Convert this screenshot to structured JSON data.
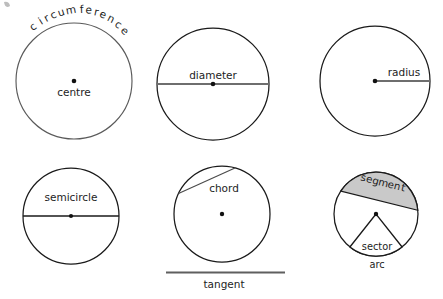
{
  "figure": {
    "background_color": "#ffffff",
    "width": 443,
    "height": 299,
    "outline_color": "#1a1a1a",
    "measure_line_color": "#6e6e6e",
    "segment_fill_color": "#c9c9c9",
    "dot_color": "#111111"
  },
  "panels": [
    {
      "id": "centre-circumference",
      "labels": {
        "circumference": "circumference",
        "centre": "centre"
      },
      "centre": {
        "x": 74,
        "y": 81
      },
      "radius": 58
    },
    {
      "id": "diameter",
      "labels": {
        "diameter": "diameter"
      },
      "centre": {
        "x": 213,
        "y": 84
      },
      "radius": 56
    },
    {
      "id": "radius",
      "labels": {
        "radius": "radius"
      },
      "centre": {
        "x": 375,
        "y": 81
      },
      "radius": 55
    },
    {
      "id": "semicircle",
      "labels": {
        "semicircle": "semicircle"
      },
      "centre": {
        "x": 71,
        "y": 216
      },
      "radius": 48
    },
    {
      "id": "chord-tangent",
      "labels": {
        "chord": "chord",
        "tangent": "tangent"
      },
      "centre": {
        "x": 222,
        "y": 214
      },
      "radius": 48
    },
    {
      "id": "segment-sector-arc",
      "labels": {
        "segment": "segment",
        "sector": "sector",
        "arc": "arc"
      },
      "centre": {
        "x": 376,
        "y": 214
      },
      "radius": 42
    }
  ],
  "curved_text": {
    "circumference_letters": [
      "c",
      "i",
      "r",
      "c",
      "u",
      "m",
      "f",
      "e",
      "r",
      "e",
      "n",
      "c",
      "e"
    ],
    "segment_letters": [
      "s",
      "e",
      "g",
      "m",
      "e",
      "n",
      "t"
    ]
  }
}
